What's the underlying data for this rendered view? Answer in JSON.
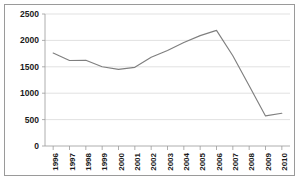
{
  "chart_data": {
    "type": "line",
    "title": "",
    "xlabel": "",
    "ylabel": "",
    "categories": [
      "1996",
      "1997",
      "1998",
      "1999",
      "2000",
      "2001",
      "2002",
      "2003",
      "2004",
      "2005",
      "2006",
      "2007",
      "2008",
      "2009",
      "2010"
    ],
    "values": [
      1760,
      1620,
      1625,
      1500,
      1450,
      1490,
      1680,
      1810,
      1960,
      2090,
      2190,
      1710,
      1140,
      570,
      620
    ],
    "series": [
      {
        "name": "series-1",
        "values": [
          1760,
          1620,
          1625,
          1500,
          1450,
          1490,
          1680,
          1810,
          1960,
          2090,
          2190,
          1710,
          1140,
          570,
          620
        ]
      }
    ],
    "ylim": [
      0,
      2500
    ],
    "yticks": [
      0,
      500,
      1000,
      1500,
      2000,
      2500
    ],
    "ytick_labels": [
      "0",
      "500",
      "1000",
      "1500",
      "2000",
      "2500"
    ],
    "grid": true,
    "grid_axis": "y",
    "legend": false,
    "legend_position": "none",
    "line_color": "#7f7f7f",
    "grid_color": "#d4d4d4",
    "axis_color": "#9a9a9a",
    "text_color": "#1a1a1a",
    "border": true,
    "xtick_label_rotation": -90
  }
}
